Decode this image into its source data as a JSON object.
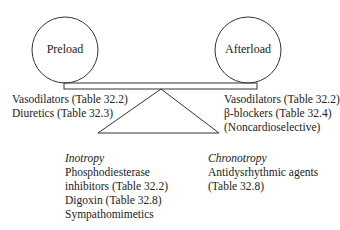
{
  "diagram": {
    "left_circle": {
      "label": "Preload"
    },
    "right_circle": {
      "label": "Afterload"
    },
    "preload_agents": [
      "Vasodilators (Table 32.2)",
      "Diuretics (Table 32.3)"
    ],
    "afterload_agents": [
      "Vasodilators (Table 32.2)",
      "β-blockers (Table 32.4)",
      "(Noncardioselective)"
    ],
    "inotropy": {
      "heading": "Inotropy",
      "items": [
        "Phosphodiesterase",
        "inhibitors (Table 32.2)",
        "Digoxin (Table 32.8)",
        "Sympathomimetics"
      ]
    },
    "chronotropy": {
      "heading": "Chronotropy",
      "items": [
        "Antidysrhythmic agents",
        "(Table 32.8)"
      ]
    }
  }
}
